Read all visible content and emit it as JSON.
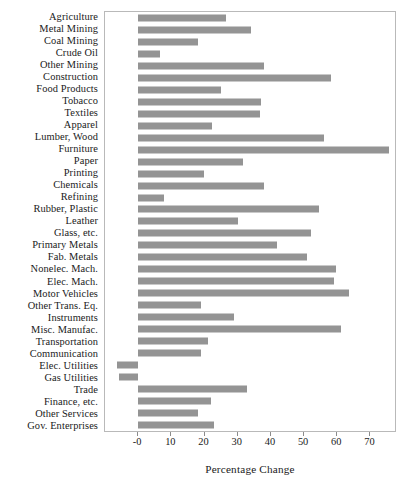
{
  "chart_data": {
    "type": "bar",
    "orientation": "horizontal",
    "title": "",
    "xlabel": "Percentage Change",
    "ylabel": "",
    "xlim": [
      -10,
      78
    ],
    "xticks": [
      0,
      10,
      20,
      30,
      40,
      50,
      60,
      70
    ],
    "xticklabels": [
      "-0",
      "10",
      "20",
      "30",
      "40",
      "50",
      "60",
      "70"
    ],
    "grid": false,
    "legend": null,
    "bar_color": "#949494",
    "frame_color": "#b9b9b9",
    "categories": [
      "Agriculture",
      "Metal Mining",
      "Coal Mining",
      "Crude Oil",
      "Other Mining",
      "Construction",
      "Food Products",
      "Tobacco",
      "Textiles",
      "Apparel",
      "Lumber, Wood",
      "Furniture",
      "Paper",
      "Printing",
      "Chemicals",
      "Refining",
      "Rubber, Plastic",
      "Leather",
      "Glass, etc.",
      "Primary Metals",
      "Fab. Metals",
      "Nonelec. Mach.",
      "Elec. Mach.",
      "Motor Vehicles",
      "Other Trans. Eq.",
      "Instruments",
      "Misc. Manufac.",
      "Transportation",
      "Communication",
      "Elec. Utilities",
      "Gas Utilities",
      "Trade",
      "Finance, etc.",
      "Other Services",
      "Gov. Enterprises"
    ],
    "values": [
      26.6,
      34.0,
      18.0,
      6.7,
      38.0,
      58.0,
      25.0,
      37.0,
      36.6,
      22.4,
      56.0,
      75.6,
      31.7,
      19.8,
      38.0,
      7.7,
      54.5,
      30.0,
      52.0,
      41.7,
      51.0,
      59.6,
      59.0,
      63.4,
      19.0,
      29.0,
      61.0,
      21.0,
      19.0,
      -6.4,
      -5.8,
      32.7,
      21.8,
      18.0,
      23.0
    ]
  }
}
